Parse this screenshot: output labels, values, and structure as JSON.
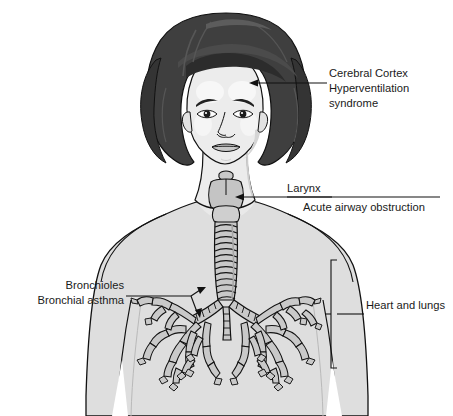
{
  "figure": {
    "style": "grayscale-line-illustration",
    "background_color": "#ffffff"
  },
  "palette": {
    "background": "#ffffff",
    "hair_dark": "#3f3f3f",
    "hair_shadow": "#2e2e2e",
    "hair_highlight": "#555555",
    "skin": "#ececec",
    "skin_shadow": "#d8d8d8",
    "skin_highlight": "#f7f7f7",
    "torso": "#dedede",
    "torso_shadow": "#cfcfcf",
    "airway": "#c9c9c9",
    "outline": "#111111",
    "label_text": "#1a1a1a"
  },
  "annotations": [
    {
      "id": "cerebral-cortex",
      "lines": [
        "Cerebral Cortex",
        "Hyperventilation",
        "syndrome"
      ],
      "align": "left",
      "text_x": 329,
      "text_y": 77,
      "line_height": 15,
      "leader": {
        "from_x": 329,
        "from_y": 83,
        "to_x": 252,
        "to_y": 83,
        "arrow": "left",
        "target": "forehead"
      }
    },
    {
      "id": "larynx",
      "lines": [
        "Larynx"
      ],
      "align": "left",
      "text_x": 287,
      "text_y": 192,
      "line_height": 15,
      "leader": {
        "from_x": 287,
        "from_y": 197,
        "to_x": 238,
        "to_y": 197,
        "arrow": "left",
        "target": "larynx-structure"
      }
    },
    {
      "id": "acute-airway-obstruction",
      "lines": [
        "Acute airway obstruction"
      ],
      "align": "left",
      "text_x": 303,
      "text_y": 210,
      "line_height": 15,
      "leader": null
    },
    {
      "id": "bronchioles",
      "lines": [
        "Bronchioles",
        "Bronchial asthma"
      ],
      "align": "right",
      "text_x": 124,
      "text_y": 289,
      "line_height": 15,
      "leader": {
        "from_x": 128,
        "from_y": 296,
        "to_x": 196,
        "to_y": 296,
        "arrow": "right-fork",
        "target": "bronchiole-branches"
      }
    },
    {
      "id": "heart-and-lungs",
      "lines": [
        "Heart and lungs"
      ],
      "align": "left",
      "text_x": 366,
      "text_y": 309,
      "line_height": 15,
      "leader": {
        "from_x": 366,
        "from_y": 314,
        "to_x": 338,
        "to_y": 314,
        "arrow": "bracket",
        "target": "thoracic-cavity"
      }
    }
  ],
  "anatomy_parts": [
    {
      "id": "hair",
      "label": "Hair"
    },
    {
      "id": "face",
      "label": "Face"
    },
    {
      "id": "eyes",
      "label": "Eyes"
    },
    {
      "id": "eyebrows",
      "label": "Eyebrows"
    },
    {
      "id": "nose",
      "label": "Nose"
    },
    {
      "id": "mouth",
      "label": "Mouth"
    },
    {
      "id": "neck",
      "label": "Neck"
    },
    {
      "id": "torso",
      "label": "Torso"
    },
    {
      "id": "larynx",
      "label": "Larynx"
    },
    {
      "id": "trachea",
      "label": "Trachea"
    },
    {
      "id": "left-bronchial-tree",
      "label": "Left bronchial tree"
    },
    {
      "id": "right-bronchial-tree",
      "label": "Right bronchial tree"
    }
  ]
}
